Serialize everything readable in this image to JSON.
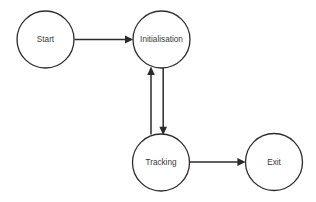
{
  "diagram": {
    "background_color": "#ffffff",
    "stroke_color": "#2b2b2b",
    "text_color": "#3a3a3a",
    "nodes": [
      {
        "id": "start",
        "label": "Start",
        "cx": 45.5,
        "cy": 39.5,
        "r": 28.5
      },
      {
        "id": "initialisation",
        "label": "Initialisation",
        "cx": 161.5,
        "cy": 39.5,
        "r": 28.5
      },
      {
        "id": "tracking",
        "label": "Tracking",
        "cx": 161.0,
        "cy": 162.5,
        "r": 28.5
      },
      {
        "id": "exit",
        "label": "Exit",
        "cx": 274.0,
        "cy": 162.0,
        "r": 28.5
      }
    ],
    "edges": [
      {
        "id": "start-to-initialisation",
        "from": "Start",
        "to": "Initialisation",
        "direction": "right"
      },
      {
        "id": "initialisation-to-tracking",
        "from": "Initialisation",
        "to": "Tracking",
        "direction": "down"
      },
      {
        "id": "tracking-to-initialisation",
        "from": "Tracking",
        "to": "Initialisation",
        "direction": "up"
      },
      {
        "id": "tracking-to-exit",
        "from": "Tracking",
        "to": "Exit",
        "direction": "right"
      }
    ]
  }
}
